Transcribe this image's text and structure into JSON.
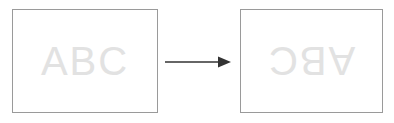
{
  "diagram": {
    "background_color": "#ffffff",
    "panel_border_color": "#9a9a9a",
    "panel_fill_color": "#ffffff",
    "text_color": "#e2e2e2",
    "arrow_color": "#333333",
    "before": {
      "label": "ABC",
      "rotation_degrees": 0
    },
    "after": {
      "label": "ABC",
      "rotation_degrees": 180
    },
    "arrow": {
      "direction": "right",
      "label": ""
    }
  }
}
